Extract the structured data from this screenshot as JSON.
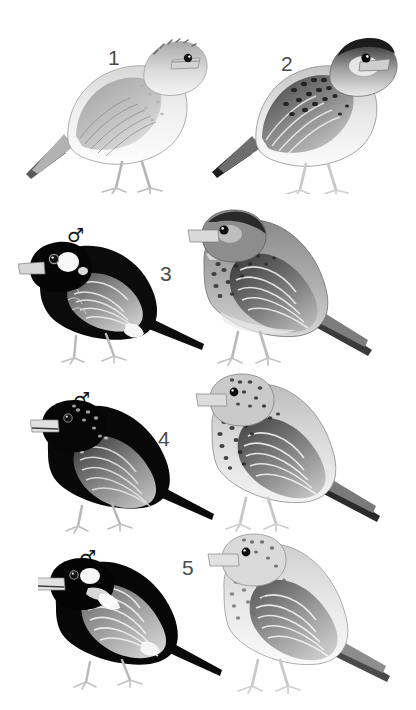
{
  "plate": {
    "background_color": "#ffffff",
    "width": 416,
    "height": 710,
    "number_color": "#4a4a4a",
    "symbol_color": "#141414"
  },
  "rows": [
    {
      "number": "1",
      "number_pos": {
        "x": 108,
        "y": 47
      },
      "figures": [
        {
          "name": "bird-1-plain",
          "sex": "",
          "pos": {
            "x": 18,
            "y": 22
          },
          "w": 190,
          "h": 170,
          "plumage": "pale-streaked",
          "body": "#f2f2f2",
          "wing": "#b8b8b8",
          "dark": "#5e5e5e"
        }
      ]
    },
    {
      "number": "2",
      "number_pos": {
        "x": 281,
        "y": 53
      },
      "figures": [
        {
          "name": "bird-2-scaled",
          "sex": "",
          "pos": {
            "x": 206,
            "y": 22
          },
          "w": 192,
          "h": 170,
          "plumage": "boldly-scaled",
          "body": "#ededed",
          "wing": "#8a8a8a",
          "dark": "#262626"
        }
      ]
    },
    {
      "number": "3",
      "number_pos": {
        "x": 160,
        "y": 263
      },
      "figures": [
        {
          "name": "bird-3-male",
          "sex": "male",
          "sex_symbol": "♂",
          "sex_pos": {
            "x": 67,
            "y": 226
          },
          "pos": {
            "x": 18,
            "y": 238
          },
          "w": 190,
          "h": 132,
          "plumage": "black-with-white-cheek",
          "body": "#0d0d0d",
          "wing": "#8f8f8f",
          "dark": "#000000"
        },
        {
          "name": "bird-3-female",
          "sex": "female",
          "sex_symbol": "♀",
          "sex_pos": {
            "x": 251,
            "y": 234
          },
          "pos": {
            "x": 186,
            "y": 208
          },
          "w": 200,
          "h": 160,
          "plumage": "dark-mottled",
          "body": "#9a9a9a",
          "wing": "#5c5c5c",
          "dark": "#1a1a1a"
        }
      ]
    },
    {
      "number": "4",
      "number_pos": {
        "x": 158,
        "y": 428
      },
      "figures": [
        {
          "name": "bird-4-male",
          "sex": "male",
          "sex_symbol": "♂",
          "sex_pos": {
            "x": 73,
            "y": 390
          },
          "pos": {
            "x": 30,
            "y": 398
          },
          "w": 190,
          "h": 140,
          "plumage": "black-with-speckled-crown",
          "body": "#0d0d0d",
          "wing": "#777777",
          "dark": "#000000"
        },
        {
          "name": "bird-4-female",
          "sex": "female",
          "sex_symbol": "♀",
          "sex_pos": {
            "x": 254,
            "y": 390
          },
          "pos": {
            "x": 194,
            "y": 370
          },
          "w": 200,
          "h": 165,
          "plumage": "heavily-streaked",
          "body": "#d8d8d8",
          "wing": "#6f6f6f",
          "dark": "#1c1c1c"
        }
      ]
    },
    {
      "number": "5",
      "number_pos": {
        "x": 182,
        "y": 557
      },
      "figures": [
        {
          "name": "bird-5-male",
          "sex": "male",
          "sex_symbol": "♂",
          "sex_pos": {
            "x": 79,
            "y": 548
          },
          "pos": {
            "x": 38,
            "y": 556
          },
          "w": 190,
          "h": 140,
          "plumage": "black-below-grey-above",
          "body": "#0d0d0d",
          "wing": "#9b9b9b",
          "dark": "#000000"
        },
        {
          "name": "bird-5-female",
          "sex": "female",
          "sex_symbol": "♀",
          "sex_pos": {
            "x": 263,
            "y": 548
          },
          "pos": {
            "x": 206,
            "y": 530
          },
          "w": 198,
          "h": 165,
          "plumage": "pale-streaked",
          "body": "#e8e8e8",
          "wing": "#8c8c8c",
          "dark": "#4a4a4a"
        }
      ]
    }
  ]
}
